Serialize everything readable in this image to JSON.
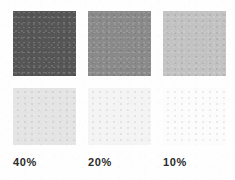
{
  "chart_data": {
    "type": "table",
    "categories": [
      "40%",
      "20%",
      "10%"
    ],
    "xlabel": "",
    "ylabel": "",
    "legend_position": "none",
    "grid": false,
    "series": [
      {
        "name": "top row",
        "values": [
          40,
          20,
          10
        ],
        "swatch_colors": [
          "#565656",
          "#8a8a8a",
          "#c2c2c2"
        ]
      },
      {
        "name": "bottom row",
        "values": [
          40,
          20,
          10
        ],
        "swatch_colors": [
          "#e4e4e4",
          "#f4f4f4",
          "#fcfcfc"
        ]
      }
    ]
  },
  "page": {
    "background_color": "#fefefe",
    "label_color": "#2b2b2b"
  },
  "swatches": {
    "top": [
      {
        "tint": "40%",
        "color": "#565656"
      },
      {
        "tint": "20%",
        "color": "#8a8a8a"
      },
      {
        "tint": "10%",
        "color": "#c2c2c2"
      }
    ],
    "bottom": [
      {
        "tint": "40%",
        "color": "#e4e4e4"
      },
      {
        "tint": "20%",
        "color": "#f4f4f4"
      },
      {
        "tint": "10%",
        "color": "#fcfcfc"
      }
    ]
  },
  "labels": [
    {
      "text": "40%"
    },
    {
      "text": "20%"
    },
    {
      "text": "10%"
    }
  ]
}
